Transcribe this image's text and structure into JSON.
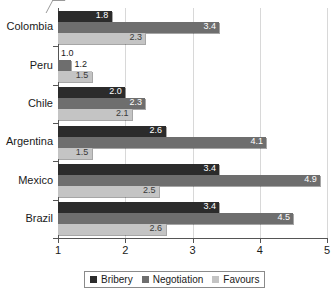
{
  "chart_data": {
    "type": "bar",
    "orientation": "horizontal",
    "title": "",
    "xlabel": "",
    "ylabel": "",
    "xlim": [
      1,
      5
    ],
    "xticks": [
      1,
      2,
      3,
      4,
      5
    ],
    "grid": true,
    "legend_position": "bottom",
    "categories": [
      "Colombia",
      "Peru",
      "Chile",
      "Argentina",
      "Mexico",
      "Brazil"
    ],
    "series": [
      {
        "name": "Bribery",
        "color": "#2b2b2b",
        "values": [
          1.8,
          1.0,
          2.0,
          2.6,
          3.4,
          3.4
        ],
        "labels": [
          "1.8",
          "1.0",
          "2.0",
          "2.6",
          "3.4",
          "3.4"
        ]
      },
      {
        "name": "Negotiation",
        "color": "#6e6e6e",
        "values": [
          3.4,
          1.2,
          2.3,
          4.1,
          4.9,
          4.5
        ],
        "labels": [
          "3.4",
          "1.2",
          "2.3",
          "4.1",
          "4.9",
          "4.5"
        ]
      },
      {
        "name": "Favours",
        "color": "#c4c4c4",
        "values": [
          2.3,
          1.5,
          2.1,
          1.5,
          2.5,
          2.6
        ],
        "labels": [
          "2.3",
          "1.5",
          "2.1",
          "1.5",
          "2.5",
          "2.6"
        ]
      }
    ]
  },
  "axis": {
    "tick_labels": [
      "1",
      "2",
      "3",
      "4",
      "5"
    ]
  },
  "legend": {
    "items": [
      {
        "label": "Bribery"
      },
      {
        "label": "Negotiation"
      },
      {
        "label": "Favours"
      }
    ]
  }
}
